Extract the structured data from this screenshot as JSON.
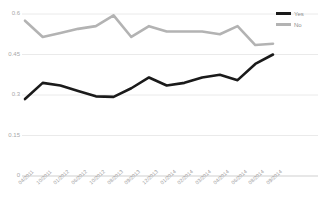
{
  "chart_data": {
    "type": "line",
    "title": "",
    "subtitle": "",
    "xlabel": "",
    "ylabel": "",
    "grid": true,
    "legend_position": "top-right",
    "ylim": [
      0,
      0.6
    ],
    "ytick_labels": [
      "0.6",
      "0.45",
      "0.3",
      "0.15",
      "0"
    ],
    "ytick_values": [
      0.6,
      0.45,
      0.3,
      0.15,
      0
    ],
    "categories": [
      "04/2011",
      "10/2011",
      "01/2012",
      "06/2012",
      "10/2012",
      "08/2013",
      "09/2013",
      "12/2013",
      "01/2014",
      "02/2014",
      "03/2014",
      "04/2014",
      "06/2014",
      "08/2014",
      "09/2014"
    ],
    "series": [
      {
        "name": "Yes",
        "color": "#1a1a1a",
        "values": [
          0.285,
          0.345,
          0.335,
          0.315,
          0.295,
          0.293,
          0.325,
          0.365,
          0.335,
          0.345,
          0.365,
          0.375,
          0.355,
          0.415,
          0.45
        ]
      },
      {
        "name": "No",
        "color": "#b3b3b3",
        "values": [
          0.575,
          0.515,
          0.53,
          0.545,
          0.555,
          0.595,
          0.515,
          0.555,
          0.535,
          0.535,
          0.535,
          0.525,
          0.555,
          0.485,
          0.49
        ]
      }
    ]
  },
  "legend": {
    "items": [
      {
        "label": "Yes",
        "color": "#1a1a1a"
      },
      {
        "label": "No",
        "color": "#b3b3b3"
      }
    ]
  }
}
